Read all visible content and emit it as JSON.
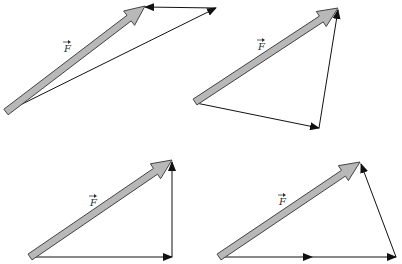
{
  "colors": {
    "force_fill": "#b8b8b8",
    "force_stroke": "#444444",
    "component_stroke": "#111111",
    "background": "#ffffff"
  },
  "label_text": "F",
  "panels": [
    {
      "id": "top-left",
      "force": {
        "from": [
          6,
          112
        ],
        "to": [
          145,
          6
        ]
      },
      "label_pos": [
        64,
        52
      ],
      "components": [
        {
          "from": [
            6,
            112
          ],
          "to": [
            216,
            8
          ]
        },
        {
          "from": [
            216,
            8
          ],
          "to": [
            145,
            7
          ]
        }
      ]
    },
    {
      "id": "top-right",
      "force": {
        "from": [
          195,
          102
        ],
        "to": [
          338,
          8
        ]
      },
      "label_pos": [
        258,
        50
      ],
      "components": [
        {
          "from": [
            196,
            103
          ],
          "to": [
            319,
            128
          ]
        },
        {
          "from": [
            319,
            128
          ],
          "to": [
            338,
            10
          ]
        }
      ]
    },
    {
      "id": "bottom-left",
      "force": {
        "from": [
          30,
          257
        ],
        "to": [
          172,
          160
        ]
      },
      "label_pos": [
        90,
        206
      ],
      "components": [
        {
          "from": [
            32,
            257
          ],
          "to": [
            172,
            257
          ]
        },
        {
          "from": [
            172,
            257
          ],
          "to": [
            172,
            162
          ]
        }
      ]
    },
    {
      "id": "bottom-right",
      "force": {
        "from": [
          219,
          257
        ],
        "to": [
          360,
          162
        ]
      },
      "label_pos": [
        279,
        205
      ],
      "components": [
        {
          "from": [
            221,
            257
          ],
          "to": [
            312,
            257
          ]
        },
        {
          "from": [
            312,
            257
          ],
          "to": [
            396,
            257
          ]
        },
        {
          "from": [
            396,
            257
          ],
          "to": [
            361,
            164
          ]
        }
      ]
    }
  ]
}
